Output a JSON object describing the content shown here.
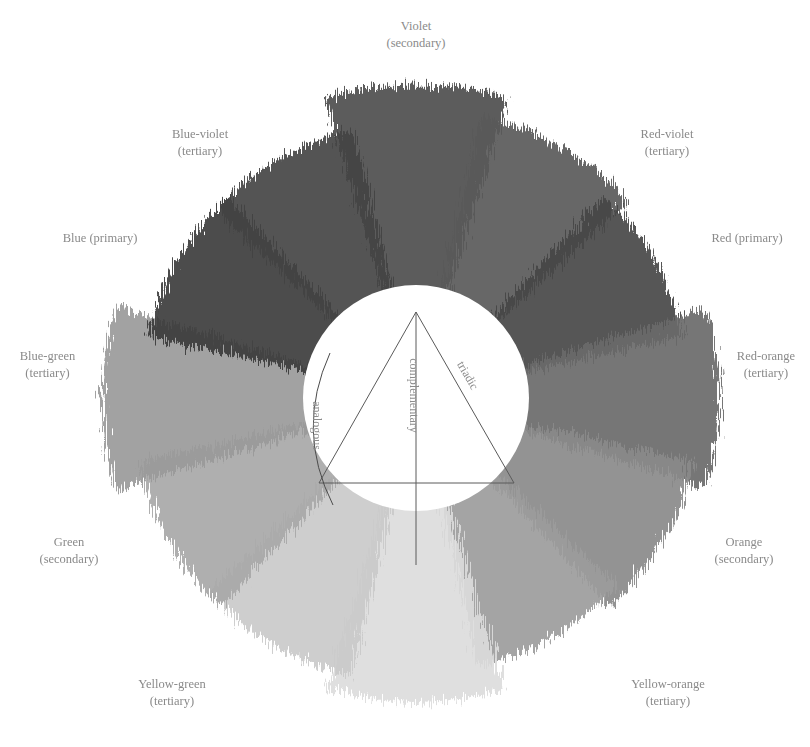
{
  "diagram": {
    "segments": [
      {
        "name": "Violet",
        "type": "(secondary)",
        "angle": 0,
        "tone": "#4e4e4e"
      },
      {
        "name": "Red-violet",
        "type": "(tertiary)",
        "angle": 30,
        "tone": "#5a5a5a"
      },
      {
        "name": "Red",
        "type": "(primary)",
        "angle": 60,
        "tone": "#474747"
      },
      {
        "name": "Red-orange",
        "type": "(tertiary)",
        "angle": 90,
        "tone": "#6a6a6a"
      },
      {
        "name": "Orange",
        "type": "(secondary)",
        "angle": 120,
        "tone": "#8a8a8a"
      },
      {
        "name": "Yellow-orange",
        "type": "(tertiary)",
        "angle": 150,
        "tone": "#9c9c9c"
      },
      {
        "name": "Yellow",
        "type": "(primary)",
        "angle": 180,
        "tone": "#dcdcdc"
      },
      {
        "name": "Yellow-green",
        "type": "(tertiary)",
        "angle": 210,
        "tone": "#cacaca"
      },
      {
        "name": "Green",
        "type": "(secondary)",
        "angle": 240,
        "tone": "#a8a8a8"
      },
      {
        "name": "Blue-green",
        "type": "(tertiary)",
        "angle": 270,
        "tone": "#9a9a9a"
      },
      {
        "name": "Blue",
        "type": "(primary)",
        "angle": 300,
        "tone": "#3c3c3c"
      },
      {
        "name": "Blue-violet",
        "type": "(tertiary)",
        "angle": 330,
        "tone": "#444444"
      }
    ],
    "labels": {
      "violet": {
        "name": "Violet",
        "type": "(secondary)"
      },
      "red_violet": {
        "name": "Red-violet",
        "type": "(tertiary)"
      },
      "red": {
        "text": "Red (primary)"
      },
      "red_orange": {
        "name": "Red-orange",
        "type": "(tertiary)"
      },
      "orange": {
        "name": "Orange",
        "type": "(secondary)"
      },
      "yellow_orange": {
        "name": "Yellow-orange",
        "type": "(tertiary)"
      },
      "yellow_green": {
        "name": "Yellow-green",
        "type": "(tertiary)"
      },
      "green": {
        "name": "Green",
        "type": "(secondary)"
      },
      "blue_green": {
        "name": "Blue-green",
        "type": "(tertiary)"
      },
      "blue": {
        "text": "Blue (primary)"
      },
      "blue_violet": {
        "name": "Blue-violet",
        "type": "(tertiary)"
      }
    },
    "harmonies": {
      "analogous": "analogous",
      "complementary": "complementary",
      "triadic": "triadic"
    },
    "colors": {
      "label_text": "#8a8a8a",
      "line": "#5a5a5a",
      "background": "#ffffff"
    }
  }
}
